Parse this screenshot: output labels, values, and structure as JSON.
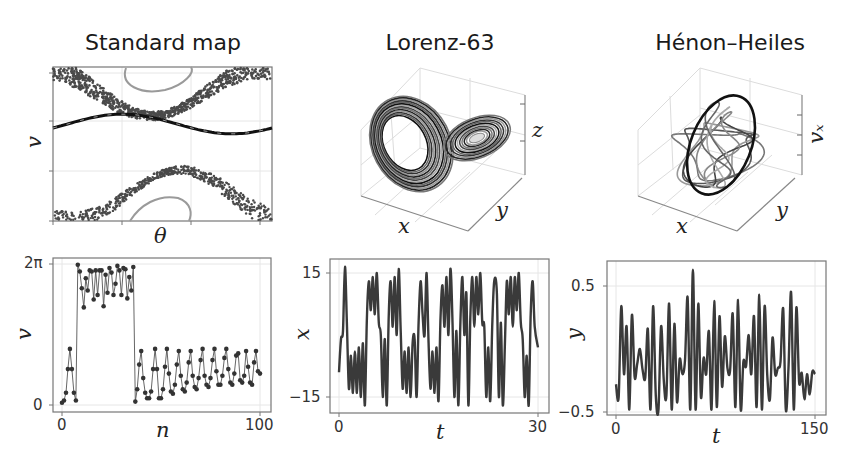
{
  "titles": {
    "standard_map": "Standard map",
    "lorenz": "Lorenz-63",
    "henon": "Hénon–Heiles"
  },
  "axis_labels": {
    "sm_phase_x": "θ",
    "sm_phase_y": "v",
    "sm_series_x": "n",
    "sm_series_y": "v",
    "lz_3d_x": "x",
    "lz_3d_y": "y",
    "lz_3d_z": "z",
    "lz_series_x": "t",
    "lz_series_y": "x",
    "hh_3d_x": "x",
    "hh_3d_y": "y",
    "hh_3d_z": "vₓ",
    "hh_series_x": "t",
    "hh_series_y": "y"
  },
  "ticks": {
    "sm_series_y_top": "2π",
    "sm_series_y_bottom": "0",
    "sm_series_x_left": "0",
    "sm_series_x_right": "100",
    "lz_series_y_top": "15",
    "lz_series_y_bottom": "−15",
    "lz_series_x_left": "0",
    "lz_series_x_right": "30",
    "hh_series_y_top": "0.5",
    "hh_series_y_bottom": "−0.5",
    "hh_series_x_left": "0",
    "hh_series_x_right": "150"
  },
  "colors": {
    "line": "#3a3a3a",
    "dark": "#111111",
    "light": "#9a9a9a",
    "grid": "#e6e6e6",
    "frame": "#777777"
  },
  "chart_data": [
    {
      "id": "standard-map-phase",
      "type": "scatter",
      "title": "Standard map",
      "xlabel": "θ",
      "ylabel": "v",
      "grid": true,
      "description": "Phase portrait: chaotic scattered bands at top and bottom, a dark invariant curve in the middle, and light-gray island orbits at top and bottom center."
    },
    {
      "id": "standard-map-series",
      "type": "line",
      "title": "Standard map",
      "xlabel": "n",
      "ylabel": "v",
      "xlim": [
        0,
        100
      ],
      "ylim": [
        0,
        6.283
      ],
      "yticks": [
        "0",
        "2π"
      ],
      "xticks": [
        "0",
        "100"
      ],
      "markers": true,
      "x": [
        0,
        1,
        2,
        3,
        4,
        5,
        6,
        7,
        8,
        9,
        10,
        11,
        12,
        13,
        14,
        15,
        16,
        17,
        18,
        19,
        20,
        21,
        22,
        23,
        24,
        25,
        26,
        27,
        28,
        29,
        30,
        31,
        32,
        33,
        34,
        35,
        36,
        37,
        38,
        39,
        40,
        41,
        42,
        43,
        44,
        45,
        46,
        47,
        48,
        49,
        50,
        51,
        52,
        53,
        54,
        55,
        56,
        57,
        58,
        59,
        60,
        61,
        62,
        63,
        64,
        65,
        66,
        67,
        68,
        69,
        70,
        71,
        72,
        73,
        74,
        75,
        76,
        77,
        78,
        79,
        80,
        81,
        82,
        83,
        84,
        85,
        86,
        87,
        88,
        89,
        90,
        91,
        92,
        93,
        94,
        95,
        96,
        97,
        98,
        99,
        100
      ],
      "values": [
        0.1,
        0.2,
        0.55,
        1.6,
        2.5,
        1.6,
        0.55,
        0.2,
        6.25,
        5.95,
        5.2,
        4.35,
        5.65,
        5.1,
        6.0,
        5.95,
        4.7,
        6.0,
        4.9,
        6.0,
        6.0,
        4.4,
        5.8,
        5.0,
        6.1,
        5.9,
        4.9,
        5.4,
        6.2,
        6.0,
        4.9,
        6.1,
        6.05,
        4.75,
        5.7,
        5.1,
        6.15,
        0.15,
        0.7,
        1.8,
        2.4,
        1.2,
        0.55,
        0.3,
        0.3,
        0.6,
        1.6,
        2.5,
        1.6,
        0.3,
        0.3,
        0.7,
        1.7,
        2.5,
        1.4,
        0.6,
        0.5,
        0.9,
        1.8,
        2.4,
        1.3,
        0.7,
        0.6,
        1.0,
        1.9,
        2.4,
        1.3,
        0.8,
        0.7,
        1.2,
        2.0,
        2.5,
        1.3,
        0.9,
        0.8,
        1.2,
        2.0,
        2.5,
        1.5,
        0.9,
        0.9,
        1.3,
        2.1,
        2.5,
        1.6,
        1.0,
        0.9,
        1.4,
        2.2,
        2.3,
        1.1,
        1.0,
        1.3,
        2.4,
        1.7,
        1.0,
        0.9,
        1.9,
        2.4,
        1.5,
        1.4
      ]
    },
    {
      "id": "lorenz-3d",
      "type": "line",
      "title": "Lorenz-63",
      "xlabel": "x",
      "ylabel": "y",
      "zlabel": "z",
      "description": "3D butterfly attractor with two lobes, plotted in grayscale."
    },
    {
      "id": "lorenz-series",
      "type": "line",
      "title": "Lorenz-63",
      "xlabel": "t",
      "ylabel": "x",
      "xlim": [
        0,
        30
      ],
      "ylim": [
        -17,
        17
      ],
      "xticks": [
        "0",
        "30"
      ],
      "yticks": [
        "−15",
        "15"
      ],
      "x": [
        0,
        0.3,
        0.6,
        0.9,
        1.2,
        1.5,
        1.8,
        2.1,
        2.4,
        2.7,
        3.0,
        3.3,
        3.6,
        3.9,
        4.2,
        4.5,
        4.8,
        5.1,
        5.4,
        5.7,
        6.0,
        6.3,
        6.6,
        6.9,
        7.2,
        7.5,
        7.8,
        8.1,
        8.4,
        8.7,
        9.0,
        9.3,
        9.6,
        9.9,
        10.2,
        10.5,
        10.8,
        11.1,
        11.4,
        11.7,
        12.0,
        12.3,
        12.6,
        12.9,
        13.2,
        13.5,
        13.8,
        14.1,
        14.4,
        14.7,
        15.0,
        15.3,
        15.6,
        15.9,
        16.2,
        16.5,
        16.8,
        17.1,
        17.4,
        17.7,
        18.0,
        18.3,
        18.6,
        18.9,
        19.2,
        19.5,
        19.8,
        20.1,
        20.4,
        20.7,
        21.0,
        21.3,
        21.6,
        21.9,
        22.2,
        22.5,
        22.8,
        23.1,
        23.4,
        23.8,
        24.1,
        24.4,
        24.7,
        25.0,
        25.3,
        25.6,
        25.9,
        26.2,
        26.5,
        26.8,
        27.1,
        27.4,
        27.7,
        28.0,
        28.3,
        28.6,
        28.9,
        29.2,
        29.5,
        30.0
      ],
      "values": [
        -9,
        -1,
        1,
        16.5,
        2,
        -13,
        -5,
        -14,
        -4,
        -14,
        -3,
        -15,
        -2,
        -17,
        4,
        13,
        6,
        14,
        5,
        15,
        3,
        0,
        -15,
        -1,
        -17,
        5,
        13,
        2,
        14,
        0,
        16,
        1,
        -13,
        -4,
        -14,
        -3,
        -15,
        -2,
        -1,
        -15,
        3,
        13,
        5,
        0,
        15,
        -2,
        -13,
        -4,
        -14,
        -3,
        -16,
        4,
        12,
        2,
        14,
        0,
        16,
        4,
        -15,
        1,
        -17,
        3,
        14,
        0,
        10,
        -17,
        4,
        14,
        2,
        14,
        5,
        15,
        3,
        2,
        -15,
        -3,
        -16,
        2,
        13,
        10,
        -15,
        3,
        -17,
        -3,
        13,
        5,
        14,
        2,
        14,
        6,
        15,
        3,
        -1,
        -15,
        -5,
        -17,
        5,
        13,
        2,
        -3
      ]
    },
    {
      "id": "henon-3d",
      "type": "line",
      "title": "Hénon–Heiles",
      "xlabel": "x",
      "ylabel": "y",
      "zlabel": "vₓ",
      "description": "3D tangled quasi-periodic orbit with a highlighted dark ellipse, plotted in grayscale."
    },
    {
      "id": "henon-series",
      "type": "line",
      "title": "Hénon–Heiles",
      "xlabel": "t",
      "ylabel": "y",
      "xlim": [
        0,
        150
      ],
      "ylim": [
        -0.52,
        0.63
      ],
      "xticks": [
        "0",
        "150"
      ],
      "yticks": [
        "−0.5",
        "0.5"
      ],
      "x": [
        0,
        2,
        4,
        6,
        8,
        10,
        12,
        14,
        16,
        18,
        20,
        22,
        24,
        26,
        28,
        30,
        32,
        34,
        36,
        38,
        40,
        42,
        44,
        46,
        48,
        50,
        52,
        54,
        56,
        58,
        60,
        62,
        64,
        66,
        68,
        70,
        72,
        74,
        76,
        78,
        80,
        82,
        84,
        86,
        88,
        90,
        92,
        94,
        96,
        98,
        100,
        102,
        104,
        106,
        108,
        110,
        112,
        114,
        116,
        118,
        120,
        122,
        124,
        126,
        128,
        130,
        132,
        134,
        136,
        138,
        140,
        142,
        144,
        146,
        148,
        150
      ],
      "values": [
        -0.28,
        -0.38,
        0.34,
        -0.2,
        0.18,
        -0.48,
        0.27,
        -0.22,
        -0.12,
        0.0,
        -0.16,
        -0.23,
        0.16,
        -0.48,
        0.34,
        -0.37,
        -0.48,
        0.18,
        -0.25,
        -0.37,
        0.36,
        -0.48,
        0.2,
        -0.42,
        -0.08,
        -0.2,
        -0.09,
        0.41,
        -0.48,
        0.63,
        -0.48,
        0.36,
        -0.38,
        -0.07,
        -0.2,
        0.14,
        -0.48,
        0.38,
        -0.46,
        0.26,
        -0.3,
        0.1,
        -0.15,
        -0.17,
        0.28,
        -0.46,
        0.39,
        -0.48,
        -0.1,
        -0.14,
        0.11,
        -0.2,
        0.26,
        -0.46,
        0.43,
        -0.48,
        0.34,
        -0.2,
        -0.4,
        0.09,
        -0.2,
        -0.15,
        -0.1,
        0.32,
        -0.48,
        -0.15,
        0.45,
        -0.48,
        0.33,
        -0.26,
        -0.19,
        -0.4,
        -0.2,
        -0.36,
        -0.18,
        -0.2
      ]
    }
  ]
}
